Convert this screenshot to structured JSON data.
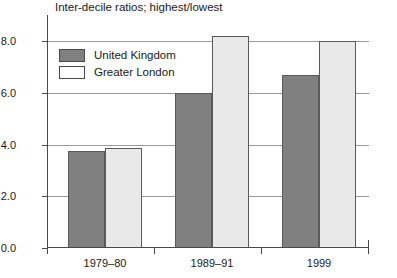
{
  "chart_data": {
    "type": "bar",
    "title": "Inter-decile ratios; highest/lowest",
    "xlabel": "",
    "ylabel": "",
    "categories": [
      "1979–80",
      "1989–91",
      "1999"
    ],
    "series": [
      {
        "name": "United Kingdom",
        "values": [
          3.75,
          6.0,
          6.7
        ],
        "color": "#808080"
      },
      {
        "name": "Greater London",
        "values": [
          3.85,
          8.2,
          8.0
        ],
        "color": "#e9e9e9"
      }
    ],
    "ylim": [
      0.0,
      9.0
    ],
    "yticks": [
      "0.0",
      "2.0",
      "4.0",
      "6.0",
      "8.0"
    ],
    "ytick_values": [
      0.0,
      2.0,
      4.0,
      6.0,
      8.0
    ],
    "grid": true,
    "legend_position": "upper-left-inside"
  },
  "legend": {
    "items": [
      {
        "label": "United Kingdom",
        "swatch": "uk"
      },
      {
        "label": "Greater London",
        "swatch": "london"
      }
    ]
  }
}
